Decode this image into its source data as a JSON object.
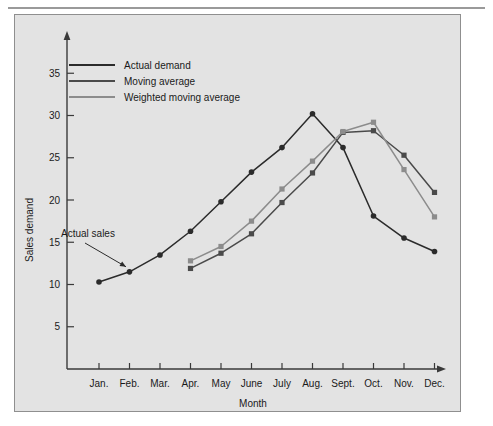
{
  "figure": {
    "background_color": "#e3e3e3",
    "border_color": "#8f8f8f",
    "rule_color": "#9a9a9a"
  },
  "chart_data": {
    "type": "line",
    "title": "",
    "xlabel": "Month",
    "ylabel": "Sales demand",
    "categories": [
      "Jan.",
      "Feb.",
      "Mar.",
      "Apr.",
      "May",
      "June",
      "July",
      "Aug.",
      "Sept.",
      "Oct.",
      "Nov.",
      "Dec."
    ],
    "ylim": [
      0,
      38
    ],
    "yticks": [
      5,
      10,
      15,
      20,
      25,
      30,
      35
    ],
    "ytick_labels": [
      "5",
      "10",
      "15",
      "20",
      "25",
      "30",
      "35"
    ],
    "grid": false,
    "legend_position": "top-left-inside",
    "series": [
      {
        "name": "Actual demand",
        "color": "#2b2b2b",
        "marker": "circle",
        "values": [
          10.3,
          11.5,
          13.5,
          16.3,
          19.8,
          23.3,
          26.2,
          30.2,
          26.2,
          18.1,
          15.5,
          13.9
        ]
      },
      {
        "name": "Moving average",
        "color": "#4a4a4a",
        "marker": "square",
        "values": [
          null,
          null,
          null,
          11.9,
          13.7,
          16.0,
          19.7,
          23.2,
          28.0,
          28.2,
          25.3,
          20.9
        ]
      },
      {
        "name": "Weighted moving average",
        "color": "#8c8c8c",
        "marker": "square",
        "values": [
          null,
          null,
          null,
          12.8,
          14.5,
          17.5,
          21.3,
          24.6,
          28.1,
          29.2,
          23.6,
          18.0
        ]
      }
    ],
    "annotations": [
      {
        "text": "Actual sales",
        "points_to_category": "Feb.",
        "points_to_value": 11.5
      }
    ]
  },
  "legend": {
    "items": [
      {
        "label": "Actual demand",
        "color": "#2b2b2b"
      },
      {
        "label": "Moving average",
        "color": "#4a4a4a"
      },
      {
        "label": "Weighted moving average",
        "color": "#8c8c8c"
      }
    ]
  },
  "axes": {
    "y_axis_title": "Sales demand",
    "x_axis_title": "Month"
  }
}
